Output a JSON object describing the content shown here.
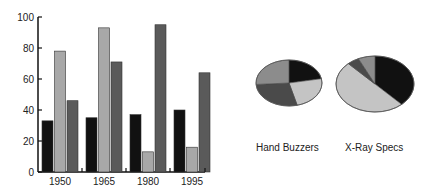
{
  "chart_data": [
    {
      "type": "bar",
      "title": "",
      "xlabel": "",
      "ylabel": "",
      "categories": [
        "1950",
        "1965",
        "1980",
        "1995"
      ],
      "series": [
        {
          "name": "Series 1",
          "color": "#111111",
          "values": [
            33,
            35,
            37,
            40
          ]
        },
        {
          "name": "Series 2",
          "color": "#a8a8a8",
          "values": [
            78,
            93,
            13,
            16
          ]
        },
        {
          "name": "Series 3",
          "color": "#5a5a5a",
          "values": [
            46,
            71,
            95,
            64
          ]
        }
      ],
      "ylim": [
        0,
        100
      ],
      "yticks": [
        0,
        20,
        40,
        60,
        80,
        100
      ],
      "grid": false,
      "legend": "none"
    },
    {
      "type": "pie",
      "title": "Hand Buzzers",
      "slices": [
        {
          "name": "Series 1",
          "color": "#111111",
          "value": 22
        },
        {
          "name": "Series 2",
          "color": "#c4c4c4",
          "value": 24
        },
        {
          "name": "Series 3",
          "color": "#4a4a4a",
          "value": 28
        },
        {
          "name": "Series 4",
          "color": "#8c8c8c",
          "value": 26
        }
      ]
    },
    {
      "type": "pie",
      "title": "X-Ray Specs",
      "slices": [
        {
          "name": "Series 1",
          "color": "#111111",
          "value": 38
        },
        {
          "name": "Series 2",
          "color": "#c4c4c4",
          "value": 50
        },
        {
          "name": "Series 3",
          "color": "#4a4a4a",
          "value": 5
        },
        {
          "name": "Series 4",
          "color": "#8c8c8c",
          "value": 7
        }
      ]
    }
  ],
  "labels": {
    "pie1": "Hand Buzzers",
    "pie2": "X-Ray Specs"
  }
}
